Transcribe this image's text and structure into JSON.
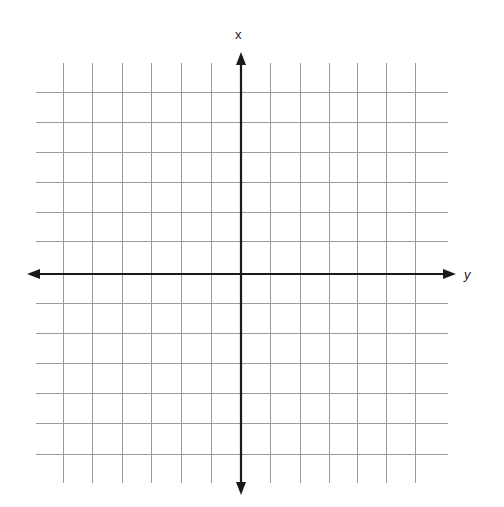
{
  "figure": {
    "title": "",
    "background_color": "#ffffff",
    "width": 504,
    "height": 507
  },
  "labels": {
    "vertical_axis_label": "x",
    "horizontal_axis_label": "y"
  },
  "styles": {
    "grid_color": "#9a9a9a",
    "grid_width": 1,
    "axis_color": "#1a1a1a",
    "axis_width": 2.2,
    "label_color": "#1a1a1a"
  },
  "chart_data": {
    "type": "line",
    "title": "",
    "subtitle": "",
    "xlabel": "y",
    "ylabel": "x",
    "xlim": [
      -6,
      6
    ],
    "ylim": [
      -6,
      6
    ],
    "xticks": [
      -6,
      -5,
      -4,
      -3,
      -2,
      -1,
      0,
      1,
      2,
      3,
      4,
      5,
      6
    ],
    "yticks": [
      -6,
      -5,
      -4,
      -3,
      -2,
      -1,
      0,
      1,
      2,
      3,
      4,
      5,
      6
    ],
    "xticklabels": [
      "",
      "",
      "",
      "",
      "",
      "",
      "",
      "",
      "",
      "",
      "",
      "",
      ""
    ],
    "yticklabels": [
      "",
      "",
      "",
      "",
      "",
      "",
      "",
      "",
      "",
      "",
      "",
      "",
      ""
    ],
    "grid": true,
    "grid_columns": 12,
    "grid_rows": 12,
    "legend": null,
    "legend_position": "none",
    "series": [],
    "annotations": [
      {
        "text": "x",
        "position": "top-of-vertical-axis"
      },
      {
        "text": "y",
        "position": "right-of-horizontal-axis"
      }
    ],
    "axes": {
      "vertical": {
        "label": "x",
        "arrow_both_ends": true,
        "origin_px": 241,
        "start_px": 52,
        "end_px": 495
      },
      "horizontal": {
        "label": "y",
        "arrow_both_ends": true,
        "origin_px": 274,
        "start_px": 27,
        "end_px": 456
      }
    },
    "geometry": {
      "vertical_gridlines_x": [
        63,
        92,
        122,
        151,
        181,
        211,
        241,
        270,
        300,
        329,
        357,
        386,
        415
      ],
      "horizontal_gridlines_y": [
        92,
        122,
        152,
        182,
        212,
        241,
        274,
        303,
        333,
        363,
        393,
        423,
        454
      ],
      "grid_vertical_span": [
        63,
        483
      ],
      "grid_horizontal_span": [
        36,
        448
      ]
    }
  }
}
